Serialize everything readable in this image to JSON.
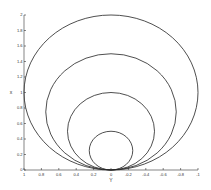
{
  "chart_data": {
    "type": "line",
    "title": "",
    "xlabel": "Y",
    "ylabel": "x",
    "xlim": [
      1,
      -1
    ],
    "ylim": [
      0,
      2
    ],
    "x_reversed": true,
    "grid": false,
    "legend": null,
    "xticks": [
      "1",
      "0.8",
      "0.6",
      "0.4",
      "0.2",
      "0",
      "-0.2",
      "-0.4",
      "-0.6",
      "-0.8",
      "-1"
    ],
    "yticks": [
      "0",
      "0.2",
      "0.4",
      "0.6",
      "0.8",
      "1",
      "1.2",
      "1.4",
      "1.6",
      "1.8",
      "2"
    ],
    "series": [
      {
        "name": "circle r=1",
        "center": [
          0,
          1
        ],
        "radius": 1
      },
      {
        "name": "circle r=0.75",
        "center": [
          0,
          0.75
        ],
        "radius": 0.75
      },
      {
        "name": "circle r=0.5",
        "center": [
          0,
          0.5
        ],
        "radius": 0.5
      },
      {
        "name": "circle r=0.25",
        "center": [
          0,
          0.25
        ],
        "radius": 0.25
      }
    ],
    "line_color": "#222222"
  }
}
